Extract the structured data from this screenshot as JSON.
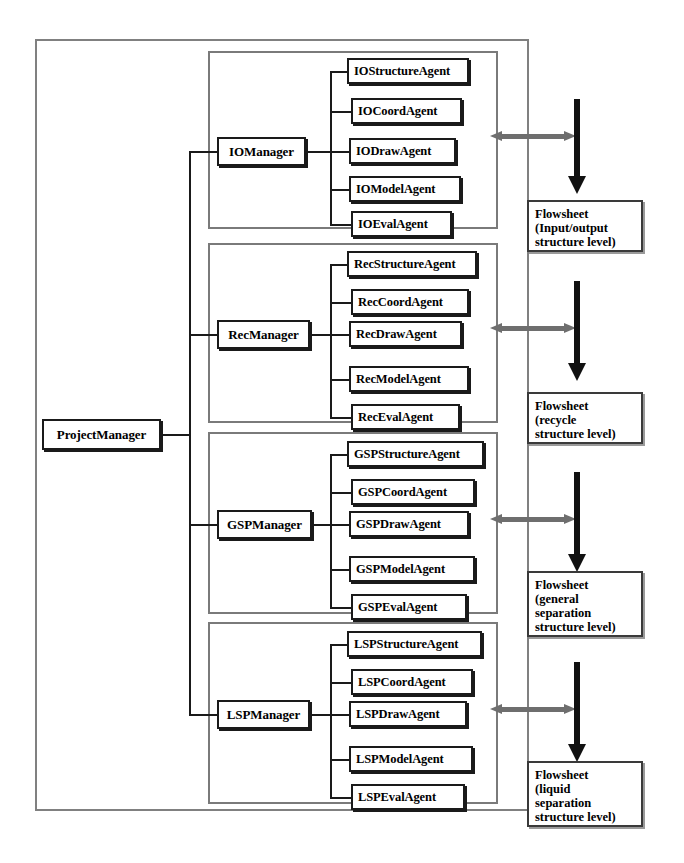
{
  "diagram": {
    "root": {
      "label": "ProjectManager"
    },
    "colors": {
      "node_border": "#1a1a1a",
      "frame": "#808080",
      "gray_arrow": "#6e6e6e",
      "black_arrow": "#111111",
      "background": "#ffffff"
    },
    "groups": [
      {
        "id": "io",
        "manager": "IOManager",
        "agents": [
          "IOStructureAgent",
          "IOCoordAgent",
          "IODrawAgent",
          "IOModelAgent",
          "IOEvalAgent"
        ],
        "flowsheet": {
          "lines": [
            "Flowsheet",
            "(Input/output",
            "structure level)"
          ]
        }
      },
      {
        "id": "rec",
        "manager": "RecManager",
        "agents": [
          "RecStructureAgent",
          "RecCoordAgent",
          "RecDrawAgent",
          "RecModelAgent",
          "RecEvalAgent"
        ],
        "flowsheet": {
          "lines": [
            "Flowsheet",
            "(recycle",
            "structure level)"
          ]
        }
      },
      {
        "id": "gsp",
        "manager": "GSPManager",
        "agents": [
          "GSPStructureAgent",
          "GSPCoordAgent",
          "GSPDrawAgent",
          "GSPModelAgent",
          "GSPEvalAgent"
        ],
        "flowsheet": {
          "lines": [
            "Flowsheet",
            "(general",
            "separation",
            "structure level)"
          ]
        }
      },
      {
        "id": "lsp",
        "manager": "LSPManager",
        "agents": [
          "LSPStructureAgent",
          "LSPCoordAgent",
          "LSPDrawAgent",
          "LSPModelAgent",
          "LSPEvalAgent"
        ],
        "flowsheet": {
          "lines": [
            "Flowsheet",
            "(liquid",
            "separation",
            "structure level)"
          ]
        }
      }
    ]
  }
}
